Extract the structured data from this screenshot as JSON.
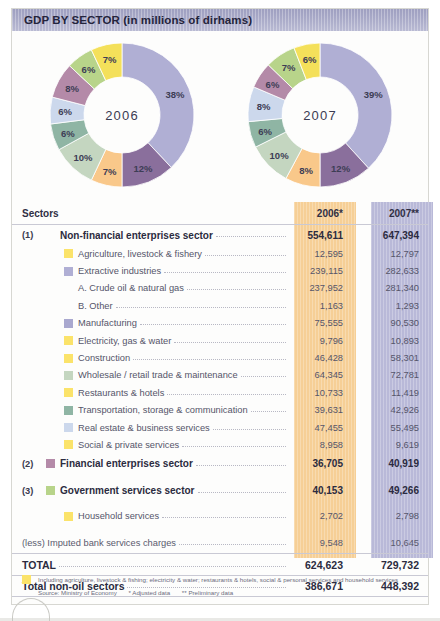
{
  "header": {
    "title": "GDP BY SECTOR (in millions of dirhams)"
  },
  "colors": {
    "title_bar": "#a9aac8",
    "band_2006": "#f6cf96",
    "band_2007": "#b9b9d8",
    "yellow": "#fbe36a",
    "lavender": "#b0afd4",
    "purple_dark": "#8a6f9c",
    "orange": "#f9c88a",
    "green_pale": "#c4d6c0",
    "teal": "#8fb5a4",
    "blue_pale": "#ccd8ec",
    "mauve": "#b48aa8",
    "green": "#b8d48a",
    "yellow2": "#f4e05a"
  },
  "table": {
    "columns": {
      "sectors": "Sectors",
      "y2006": "2006*",
      "y2007": "2007**"
    },
    "rows": [
      {
        "num": "(1)",
        "label": "Non-financial enterprises sector",
        "v2006": "554,611",
        "v2007": "647,394",
        "level": 1,
        "swatch": ""
      },
      {
        "num": "",
        "label": "Agriculture, livestock & fishery",
        "v2006": "12,595",
        "v2007": "12,797",
        "level": 2,
        "swatch": "#fbe36a"
      },
      {
        "num": "",
        "label": "Extractive industries",
        "v2006": "239,115",
        "v2007": "282,633",
        "level": 2,
        "swatch": "#b0afd4"
      },
      {
        "num": "",
        "label": "A. Crude oil & natural gas",
        "v2006": "237,952",
        "v2007": "281,340",
        "level": 3,
        "swatch": ""
      },
      {
        "num": "",
        "label": "B. Other",
        "v2006": "1,163",
        "v2007": "1,293",
        "level": 3,
        "swatch": ""
      },
      {
        "num": "",
        "label": "Manufacturing",
        "v2006": "75,555",
        "v2007": "90,530",
        "level": 2,
        "swatch": "#a9a8cf"
      },
      {
        "num": "",
        "label": "Electricity, gas & water",
        "v2006": "9,796",
        "v2007": "10,893",
        "level": 2,
        "swatch": "#fbe36a"
      },
      {
        "num": "",
        "label": "Construction",
        "v2006": "46,428",
        "v2007": "58,301",
        "level": 2,
        "swatch": "#fbe36a"
      },
      {
        "num": "",
        "label": "Wholesale / retail trade & maintenance",
        "v2006": "64,345",
        "v2007": "72,781",
        "level": 2,
        "swatch": "#c4d6c0"
      },
      {
        "num": "",
        "label": "Restaurants & hotels",
        "v2006": "10,733",
        "v2007": "11,419",
        "level": 2,
        "swatch": "#fbe36a"
      },
      {
        "num": "",
        "label": "Transportation, storage & communication",
        "v2006": "39,631",
        "v2007": "42,926",
        "level": 2,
        "swatch": "#8fb5a4"
      },
      {
        "num": "",
        "label": "Real estate & business services",
        "v2006": "47,455",
        "v2007": "55,495",
        "level": 2,
        "swatch": "#ccd8ec"
      },
      {
        "num": "",
        "label": "Social & private services",
        "v2006": "8,958",
        "v2007": "9,619",
        "level": 2,
        "swatch": "#fbe36a"
      },
      {
        "num": "(2)",
        "label": "Financial enterprises sector",
        "v2006": "36,705",
        "v2007": "40,919",
        "level": 1,
        "swatch": "#b48aa8"
      },
      {
        "num": "(3)",
        "label": "Government services sector",
        "v2006": "40,153",
        "v2007": "49,266",
        "level": 1,
        "swatch": "#b8d48a"
      },
      {
        "num": "",
        "label": "Household services",
        "v2006": "2,702",
        "v2007": "2,798",
        "level": 2,
        "swatch": "#fbe36a"
      }
    ],
    "imputed": {
      "label": "(less) Imputed bank services charges",
      "v2006": "9,548",
      "v2007": "10,645"
    },
    "total": {
      "label": "TOTAL",
      "v2006": "624,623",
      "v2007": "729,732"
    },
    "total_non_oil": {
      "label": "Total non-oil sectors",
      "v2006": "386,671",
      "v2007": "448,392"
    }
  },
  "footnote": {
    "note": "Including agriculture, livestock & fishing; electricity & water; restaurants & hotels, social & personal services and household services",
    "source": "Source: Ministry of Economy",
    "adjusted": "* Adjusted data",
    "preliminary": "** Preliminary data"
  },
  "chart_data": [
    {
      "type": "pie",
      "title": "2006",
      "center_label": "2006",
      "labels": [
        "Extractive industries",
        "Manufacturing",
        "Construction",
        "Wholesale / retail trade & maintenance",
        "Transportation, storage & communication",
        "Real estate & business services",
        "Financial enterprises sector",
        "Government services sector",
        "Other (yellow group)"
      ],
      "values": [
        38,
        12,
        7,
        10,
        6,
        6,
        8,
        6,
        7
      ],
      "display_labels": [
        "38%",
        "12%",
        "7%",
        "10%",
        "6%",
        "6%",
        "8%",
        "6%",
        "7%"
      ],
      "colors": [
        "#b0afd4",
        "#8a6f9c",
        "#f9c88a",
        "#c4d6c0",
        "#8fb5a4",
        "#ccd8ec",
        "#b48aa8",
        "#b8d48a",
        "#f4e05a"
      ],
      "legend": "off",
      "grid": "off"
    },
    {
      "type": "pie",
      "title": "2007",
      "center_label": "2007",
      "labels": [
        "Extractive industries",
        "Manufacturing",
        "Construction",
        "Wholesale / retail trade & maintenance",
        "Transportation, storage & communication",
        "Real estate & business services",
        "Financial enterprises sector",
        "Government services sector",
        "Other (yellow group)"
      ],
      "values": [
        39,
        12,
        8,
        10,
        6,
        8,
        6,
        7,
        6
      ],
      "display_labels": [
        "39%",
        "12%",
        "8%",
        "10%",
        "6%",
        "8%",
        "6%",
        "7%",
        "6%"
      ],
      "colors": [
        "#b0afd4",
        "#8a6f9c",
        "#f9c88a",
        "#c4d6c0",
        "#8fb5a4",
        "#ccd8ec",
        "#b48aa8",
        "#b8d48a",
        "#f4e05a"
      ],
      "legend": "off",
      "grid": "off"
    }
  ]
}
